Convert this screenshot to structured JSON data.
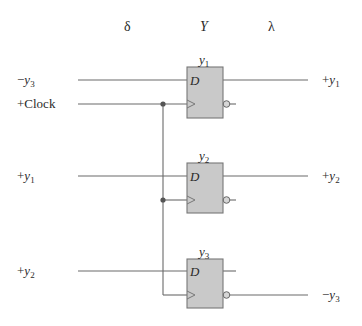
{
  "headers": {
    "delta": "δ",
    "Y": "Y",
    "lambda": "λ"
  },
  "colors": {
    "wire": "#6a6a6a",
    "flipflop_fill": "#c9c9c9",
    "flipflop_border": "#777777",
    "text": "#2a2a2a",
    "junction": "#555555"
  },
  "inputs": [
    {
      "sign": "−",
      "var": "y",
      "sub": "3"
    },
    {
      "label": "+Clock"
    },
    {
      "sign": "+",
      "var": "y",
      "sub": "1"
    },
    {
      "sign": "+",
      "var": "y",
      "sub": "2"
    }
  ],
  "flipflops": [
    {
      "name_var": "y",
      "name_sub": "1",
      "d_label": "D"
    },
    {
      "name_var": "y",
      "name_sub": "2",
      "d_label": "D"
    },
    {
      "name_var": "y",
      "name_sub": "3",
      "d_label": "D"
    }
  ],
  "outputs": [
    {
      "sign": "+",
      "var": "y",
      "sub": "1"
    },
    {
      "sign": "+",
      "var": "y",
      "sub": "2"
    },
    {
      "sign": "−",
      "var": "y",
      "sub": "3"
    }
  ]
}
